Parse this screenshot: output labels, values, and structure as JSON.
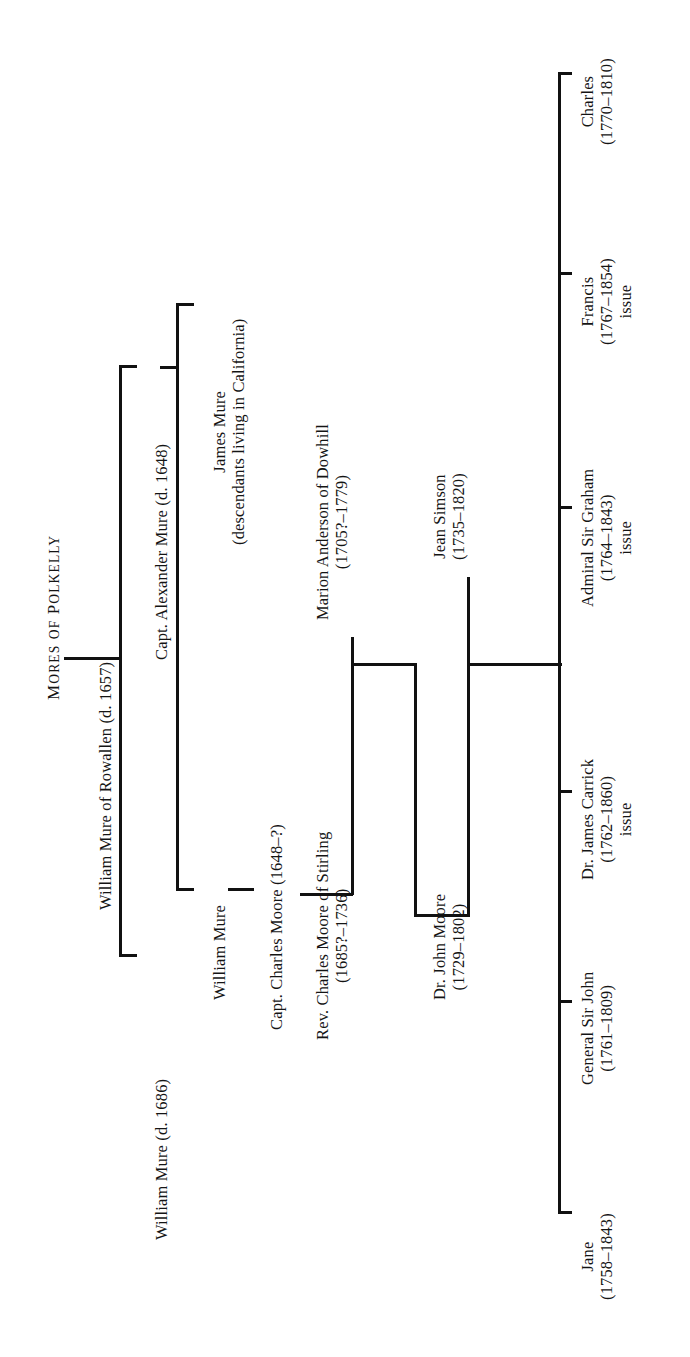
{
  "title": {
    "word1_caps": "M",
    "word1_rest": "ORES",
    "word2_caps": "",
    "word2_rest": "OF",
    "full": "MORES OF POLKELLY",
    "part_a_big": "M",
    "part_a_small": "ORES",
    "part_b_small": "OF",
    "part_c_big": "P",
    "part_c_small": "OLKELLY"
  },
  "tree": {
    "root": {
      "name": "William Mure of Rowallen",
      "dates": "(d. 1657)"
    },
    "generation2": [
      {
        "name": "Capt. Alexander Mure",
        "dates": "(d. 1648)"
      },
      {
        "name": "William Mure",
        "dates": "(d. 1686)"
      }
    ],
    "generation3": [
      {
        "name": "James Mure",
        "note": "(descendants living in California)"
      },
      {
        "name": "William Mure",
        "note": ""
      },
      {
        "name": "Capt. Charles Moore",
        "dates": "(1648–?)"
      }
    ],
    "generation4": [
      {
        "name": "Rev. Charles Moore of Stirling",
        "dates": "(1685?–1736)"
      },
      {
        "name": "Marion Anderson of Dowhill",
        "dates": "(1705?–1779)"
      }
    ],
    "generation5": [
      {
        "name": "Dr. John Moore",
        "dates": "(1729–1802)"
      },
      {
        "name": "Jean Simson",
        "dates": "(1735–1820)"
      }
    ],
    "children": [
      {
        "name": "Jane",
        "dates": "(1758–1843)",
        "note": ""
      },
      {
        "name": "General Sir John",
        "dates": "(1761–1809)",
        "note": ""
      },
      {
        "name": "Dr. James Carrick",
        "dates": "(1762–1860)",
        "note": "issue"
      },
      {
        "name": "Admiral Sir Graham",
        "dates": "(1764–1843)",
        "note": "issue"
      },
      {
        "name": "Francis",
        "dates": "(1767–1854)",
        "note": "issue"
      },
      {
        "name": "Charles",
        "dates": "(1770–1810)",
        "note": ""
      }
    ]
  },
  "colors": {
    "ink": "#141414",
    "line": "#111111",
    "paper": "#ffffff"
  }
}
